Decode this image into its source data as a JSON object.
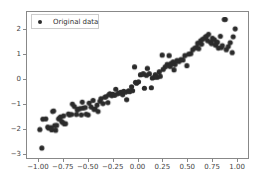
{
  "chart_data": {
    "type": "scatter",
    "title": "",
    "xlabel": "",
    "ylabel": "",
    "xlim": [
      -1.12,
      1.12
    ],
    "ylim": [
      -3.18,
      2.72
    ],
    "grid": false,
    "legend_position": "upper left",
    "series": [
      {
        "name": "Original data",
        "marker": "o",
        "color": "#2b2b2b",
        "marker_size": 4,
        "points": [
          [
            -0.99,
            -2.03
          ],
          [
            -0.97,
            -2.78
          ],
          [
            -0.96,
            -1.61
          ],
          [
            -0.93,
            -1.6
          ],
          [
            -0.91,
            -1.93
          ],
          [
            -0.9,
            -1.97
          ],
          [
            -0.88,
            -1.95
          ],
          [
            -0.87,
            -2.04
          ],
          [
            -0.86,
            -1.3
          ],
          [
            -0.85,
            -1.28
          ],
          [
            -0.84,
            -1.87
          ],
          [
            -0.83,
            -2.06
          ],
          [
            -0.82,
            -1.86
          ],
          [
            -0.8,
            -1.6
          ],
          [
            -0.79,
            -1.56
          ],
          [
            -0.78,
            -1.52
          ],
          [
            -0.77,
            -1.7
          ],
          [
            -0.76,
            -1.74
          ],
          [
            -0.75,
            -1.48
          ],
          [
            -0.74,
            -1.8
          ],
          [
            -0.73,
            -1.79
          ],
          [
            -0.7,
            -1.4
          ],
          [
            -0.69,
            -1.44
          ],
          [
            -0.67,
            -1.42
          ],
          [
            -0.66,
            -1.0
          ],
          [
            -0.64,
            -1.1
          ],
          [
            -0.62,
            -1.42
          ],
          [
            -0.61,
            -1.24
          ],
          [
            -0.6,
            -1.2
          ],
          [
            -0.58,
            -1.18
          ],
          [
            -0.57,
            -1.44
          ],
          [
            -0.56,
            -0.92
          ],
          [
            -0.55,
            -1.16
          ],
          [
            -0.53,
            -1.14
          ],
          [
            -0.52,
            -1.41
          ],
          [
            -0.5,
            -1.44
          ],
          [
            -0.49,
            -0.96
          ],
          [
            -0.47,
            -1.12
          ],
          [
            -0.45,
            -0.85
          ],
          [
            -0.44,
            -1.22
          ],
          [
            -0.43,
            -1.2
          ],
          [
            -0.41,
            -1.04
          ],
          [
            -0.4,
            -1.3
          ],
          [
            -0.38,
            -0.88
          ],
          [
            -0.37,
            -0.78
          ],
          [
            -0.35,
            -0.98
          ],
          [
            -0.33,
            -0.72
          ],
          [
            -0.32,
            -0.7
          ],
          [
            -0.3,
            -0.94
          ],
          [
            -0.29,
            -0.62
          ],
          [
            -0.28,
            -0.58
          ],
          [
            -0.26,
            -0.66
          ],
          [
            -0.25,
            -0.6
          ],
          [
            -0.23,
            -0.64
          ],
          [
            -0.22,
            -0.4
          ],
          [
            -0.2,
            -0.58
          ],
          [
            -0.19,
            -0.56
          ],
          [
            -0.17,
            -0.52
          ],
          [
            -0.15,
            -0.62
          ],
          [
            -0.14,
            -0.48
          ],
          [
            -0.12,
            -0.52
          ],
          [
            -0.11,
            -0.82
          ],
          [
            -0.09,
            -0.46
          ],
          [
            -0.08,
            -0.5
          ],
          [
            -0.06,
            -0.3
          ],
          [
            -0.05,
            -0.46
          ],
          [
            -0.03,
            0.5
          ],
          [
            -0.02,
            -0.12
          ],
          [
            -0.01,
            -0.16
          ],
          [
            0.01,
            -0.1
          ],
          [
            0.03,
            0.18
          ],
          [
            0.05,
            0.2
          ],
          [
            0.06,
            0.22
          ],
          [
            0.07,
            -0.36
          ],
          [
            0.09,
            0.16
          ],
          [
            0.1,
            0.44
          ],
          [
            0.12,
            0.22
          ],
          [
            0.14,
            -0.34
          ],
          [
            0.15,
            0.05
          ],
          [
            0.17,
            0.08
          ],
          [
            0.18,
            0.18
          ],
          [
            0.2,
            0.08
          ],
          [
            0.22,
            0.3
          ],
          [
            0.23,
            0.12
          ],
          [
            0.25,
            0.98
          ],
          [
            0.26,
            0.4
          ],
          [
            0.28,
            0.5
          ],
          [
            0.3,
            0.6
          ],
          [
            0.32,
            0.96
          ],
          [
            0.33,
            0.52
          ],
          [
            0.34,
            0.64
          ],
          [
            0.36,
            0.7
          ],
          [
            0.37,
            0.38
          ],
          [
            0.38,
            0.6
          ],
          [
            0.4,
            0.76
          ],
          [
            0.42,
            0.72
          ],
          [
            0.44,
            0.8
          ],
          [
            0.46,
            0.78
          ],
          [
            0.48,
            0.96
          ],
          [
            0.5,
            0.55
          ],
          [
            0.52,
            1.02
          ],
          [
            0.54,
            1.04
          ],
          [
            0.56,
            1.2
          ],
          [
            0.58,
            1.26
          ],
          [
            0.6,
            1.3
          ],
          [
            0.61,
            1.46
          ],
          [
            0.62,
            1.24
          ],
          [
            0.64,
            1.56
          ],
          [
            0.65,
            1.42
          ],
          [
            0.66,
            1.62
          ],
          [
            0.68,
            1.66
          ],
          [
            0.69,
            1.72
          ],
          [
            0.7,
            1.74
          ],
          [
            0.71,
            1.56
          ],
          [
            0.72,
            1.82
          ],
          [
            0.74,
            1.5
          ],
          [
            0.75,
            1.44
          ],
          [
            0.76,
            1.66
          ],
          [
            0.78,
            1.6
          ],
          [
            0.79,
            1.38
          ],
          [
            0.8,
            1.46
          ],
          [
            0.81,
            1.5
          ],
          [
            0.82,
            1.26
          ],
          [
            0.84,
            1.74
          ],
          [
            0.85,
            1.28
          ],
          [
            0.86,
            1.36
          ],
          [
            0.88,
            2.42
          ],
          [
            0.89,
            2.42
          ],
          [
            0.9,
            1.2
          ],
          [
            0.92,
            1.32
          ],
          [
            0.94,
            1.48
          ],
          [
            0.96,
            1.08
          ],
          [
            0.97,
            1.72
          ],
          [
            0.99,
            2.04
          ]
        ]
      }
    ],
    "xticks": [
      {
        "value": -1.0,
        "label": "−1.00"
      },
      {
        "value": -0.75,
        "label": "−0.75"
      },
      {
        "value": -0.5,
        "label": "−0.50"
      },
      {
        "value": -0.25,
        "label": "−0.25"
      },
      {
        "value": 0.0,
        "label": "0.00"
      },
      {
        "value": 0.25,
        "label": "0.25"
      },
      {
        "value": 0.5,
        "label": "0.50"
      },
      {
        "value": 0.75,
        "label": "0.75"
      },
      {
        "value": 1.0,
        "label": "1.00"
      }
    ],
    "yticks": [
      {
        "value": 2,
        "label": "2"
      },
      {
        "value": 1,
        "label": "1"
      },
      {
        "value": 0,
        "label": "0"
      },
      {
        "value": -1,
        "label": "−1"
      },
      {
        "value": -2,
        "label": "−2"
      },
      {
        "value": -3,
        "label": "−3"
      }
    ]
  },
  "legend": {
    "entries": [
      {
        "label": "Original data",
        "marker": "scatter-marker-icon",
        "color": "#2b2b2b"
      }
    ]
  },
  "style": {
    "background": "#ffffff",
    "marker_color": "#2b2b2b",
    "axis_color": "#888888",
    "tick_label_color": "#444444",
    "legend_border_color": "#cccccc"
  }
}
